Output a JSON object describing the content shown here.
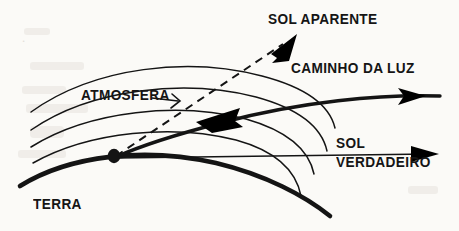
{
  "figure": {
    "background_color": "#fbfaf7",
    "ink_color": "#141414",
    "labels": {
      "sol_aparente": "SOL APARENTE",
      "caminho_da_luz": "CAMINHO DA LUZ",
      "atmosfera": "ATMOSFERA",
      "sol_verdadeiro_line1": "SOL",
      "sol_verdadeiro_line2": "VERDADEIRO",
      "terra": "TERRA"
    },
    "elements": {
      "earth_curve": "thick-arc-earth-surface",
      "atmosphere_arcs": "four-thin-concentric-arcs",
      "light_path": "thick-curved-refracted-ray",
      "apparent_sun_ray": "dashed-straight-ray",
      "true_sun_line": "thin-straight-horizontal-line",
      "observer": "observer-dot"
    }
  }
}
